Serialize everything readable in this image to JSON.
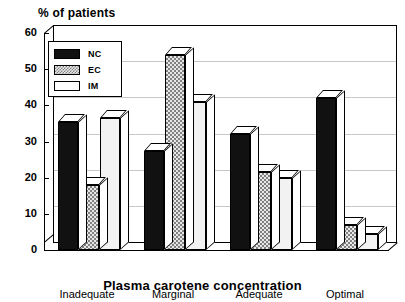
{
  "chart_data": {
    "type": "bar",
    "title": "",
    "ylabel": "% of patients",
    "xlabel": "Plasma carotene concentration",
    "categories": [
      "Inadequate",
      "Marginal",
      "Adequate",
      "Optimal"
    ],
    "series": [
      {
        "name": "NC",
        "values": [
          35.5,
          27.5,
          32.0,
          42.0
        ],
        "color": "#111111"
      },
      {
        "name": "EC",
        "values": [
          18.0,
          54.0,
          21.5,
          7.0
        ],
        "color": "#c0c0c0"
      },
      {
        "name": "IM",
        "values": [
          36.5,
          41.0,
          20.0,
          4.5
        ],
        "color": "#f2f2f2"
      }
    ],
    "ylim": [
      0,
      60
    ],
    "yticks": [
      0,
      10,
      20,
      30,
      40,
      50,
      60
    ],
    "ytick_labels": [
      "0",
      "10",
      "20",
      "30",
      "40",
      "50",
      "60"
    ],
    "grid": true,
    "legend_position": "top-left",
    "style": "3d-bar"
  },
  "legend": {
    "entries": [
      {
        "label": "NC",
        "swatch": "black-solid"
      },
      {
        "label": "EC",
        "swatch": "grey-checker"
      },
      {
        "label": "IM",
        "swatch": "white-empty"
      }
    ]
  }
}
